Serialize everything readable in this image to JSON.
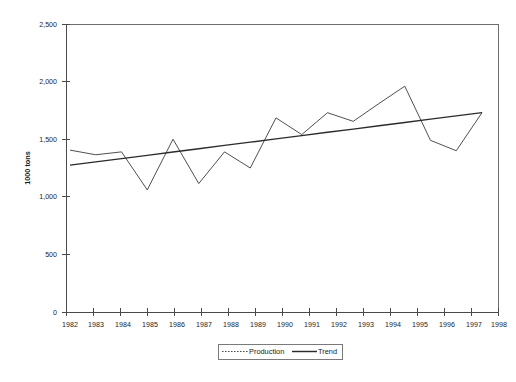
{
  "chart_data": {
    "type": "line",
    "title": "",
    "xlabel": "",
    "ylabel": "1000 tons",
    "x": [
      1982,
      1983,
      1984,
      1985,
      1986,
      1987,
      1988,
      1989,
      1990,
      1991,
      1992,
      1993,
      1994,
      1995,
      1996,
      1997,
      1998
    ],
    "categories": [
      "1982",
      "1983",
      "1984",
      "1985",
      "1986",
      "1987",
      "1988",
      "1989",
      "1990",
      "1991",
      "1992",
      "1993",
      "1994",
      "1995",
      "1996",
      "1997",
      "1998"
    ],
    "series": [
      {
        "name": "Production",
        "style": "dotted",
        "values": [
          1405,
          1365,
          1390,
          1060,
          1500,
          1115,
          1390,
          1250,
          1685,
          1540,
          1730,
          1655,
          1810,
          1960,
          1490,
          1400,
          1730
        ]
      },
      {
        "name": "Trend",
        "style": "solid",
        "values": [
          1275,
          1303,
          1332,
          1360,
          1389,
          1417,
          1446,
          1474,
          1503,
          1531,
          1560,
          1588,
          1617,
          1645,
          1674,
          1702,
          1730
        ]
      }
    ],
    "ylim": [
      0,
      2500
    ],
    "yticks": [
      0,
      500,
      1000,
      1500,
      2000,
      2500
    ],
    "ytick_labels": [
      "0",
      "500",
      "1,000",
      "1,500",
      "2,000",
      "2,500"
    ],
    "xlim": [
      1982,
      1998
    ],
    "grid": false,
    "legend_position": "bottom",
    "legend_entries": [
      "Production",
      "Trend"
    ],
    "colors": {
      "production": "#3b3b3b",
      "trend": "#2b2b2b",
      "axis": "#4a4a4a",
      "border": "#6e6e6e",
      "background": "#ffffff"
    }
  },
  "legend": {
    "production_label": "Production",
    "trend_label": "Trend"
  },
  "axes": {
    "y_title": "1000 tons"
  }
}
